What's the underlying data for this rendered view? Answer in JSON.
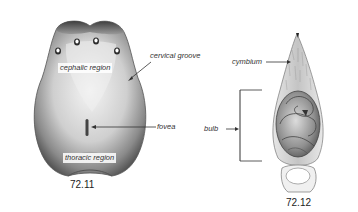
{
  "figures": [
    {
      "id": "72.11",
      "caption": "72.11",
      "subject": "carapace",
      "labels": {
        "cephalic": "cephalic region",
        "cervical": "cervical groove",
        "fovea": "fovea",
        "thoracic": "thoracic region"
      }
    },
    {
      "id": "72.12",
      "caption": "72.12",
      "subject": "pedipalp",
      "labels": {
        "cymbium": "cymbium",
        "bulb": "bulb"
      }
    }
  ],
  "colors": {
    "background": "#ffffff",
    "line": "#333333",
    "shade_dark": "#4a4a4a",
    "shade_light": "#f2f2f2"
  }
}
